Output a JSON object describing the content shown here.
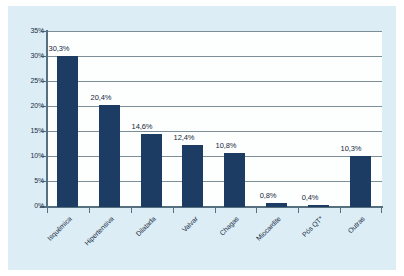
{
  "chart_data": {
    "type": "bar",
    "title": "",
    "subtitle": "",
    "xlabel": "",
    "ylabel": "",
    "categories": [
      "Isquêmica",
      "Hipertensiva",
      "Dilatada",
      "Valvar",
      "Chagas",
      "Miocardite",
      "Pós QT*",
      "Outras"
    ],
    "values": [
      30.3,
      20.4,
      14.6,
      12.4,
      10.8,
      0.8,
      0.4,
      10.3
    ],
    "value_labels": [
      "30,3%",
      "20,4%",
      "14,6%",
      "12,4%",
      "10,8%",
      "0,8%",
      "0,4%",
      "10,3%"
    ],
    "ylim": [
      0,
      35
    ],
    "ytick_values": [
      0,
      5,
      10,
      15,
      20,
      25,
      30,
      35
    ],
    "ytick_labels": [
      "0%",
      "5%",
      "10%",
      "15%",
      "20%",
      "25%",
      "30%",
      "35%"
    ],
    "grid": true,
    "grid_orientation": "horizontal",
    "legend": false,
    "legend_position": "none",
    "bar_color": "#1c3c64",
    "plot_background_color": "#fdfefe",
    "figure_background_color": "#dcedf6",
    "gridline_color": "#7e8e96",
    "axis_color": "#56707f",
    "text_color": "#1b2f42",
    "xtick_label_rotation": -45
  }
}
